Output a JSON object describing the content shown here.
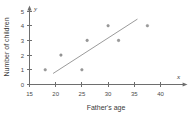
{
  "chart_data": {
    "type": "scatter",
    "title": "",
    "xlabel": "Father's age",
    "ylabel": "Number of children",
    "x_axis_symbol": "x",
    "y_axis_symbol": "y",
    "xlim": [
      15,
      42
    ],
    "ylim": [
      0,
      5.3
    ],
    "xticks": [
      15,
      20,
      25,
      30,
      35,
      40
    ],
    "yticks": [
      0,
      1,
      2,
      3,
      4,
      5
    ],
    "xtick_labels": [
      "15",
      "20",
      "25",
      "30",
      "35",
      "40"
    ],
    "ytick_labels": [
      "0",
      "1",
      "2",
      "3",
      "4",
      "5"
    ],
    "grid": false,
    "legend": false,
    "points": [
      {
        "x": 18,
        "y": 1
      },
      {
        "x": 21,
        "y": 2
      },
      {
        "x": 25,
        "y": 1
      },
      {
        "x": 26,
        "y": 3
      },
      {
        "x": 30,
        "y": 4
      },
      {
        "x": 32,
        "y": 3
      },
      {
        "x": 37.5,
        "y": 4
      }
    ],
    "trend_line": {
      "name": "line of best fit",
      "x_start": 19.5,
      "y_start": 0.75,
      "x_end": 35.6,
      "y_end": 4.45
    },
    "colors": {
      "point": "#9a9a9a",
      "line": "#9b9b9b",
      "axis": "#6e6e6e",
      "text": "#3a3a3a",
      "background": "#ffffff"
    }
  }
}
